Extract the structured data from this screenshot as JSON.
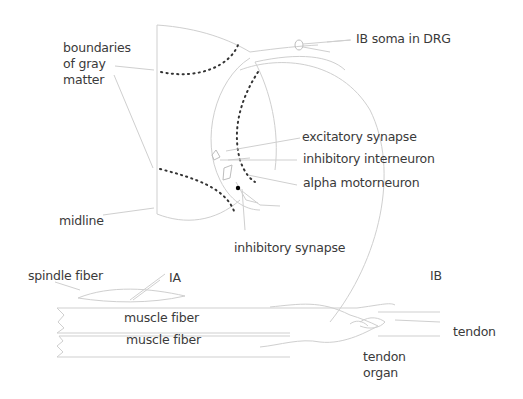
{
  "diagram": {
    "labels": {
      "boundaries_gray_matter": [
        "boundaries",
        "of gray",
        "matter"
      ],
      "ib_soma": "IB soma in DRG",
      "excitatory_synapse": "excitatory synapse",
      "inhibitory_interneuron": "inhibitory interneuron",
      "alpha_motorneuron": "alpha motorneuron",
      "midline": "midline",
      "inhibitory_synapse": "inhibitory synapse",
      "spindle_fiber": "spindle fiber",
      "ia": "IA",
      "ib": "IB",
      "muscle_fiber_1": "muscle fiber",
      "muscle_fiber_2": "muscle fiber",
      "tendon": "tendon",
      "tendon_organ": [
        "tendon",
        "organ"
      ]
    },
    "colors": {
      "line": "#cfcfcf",
      "dotted_boundary": "#333333",
      "text": "#3a3a3a",
      "synapse_dot": "#000000"
    }
  }
}
